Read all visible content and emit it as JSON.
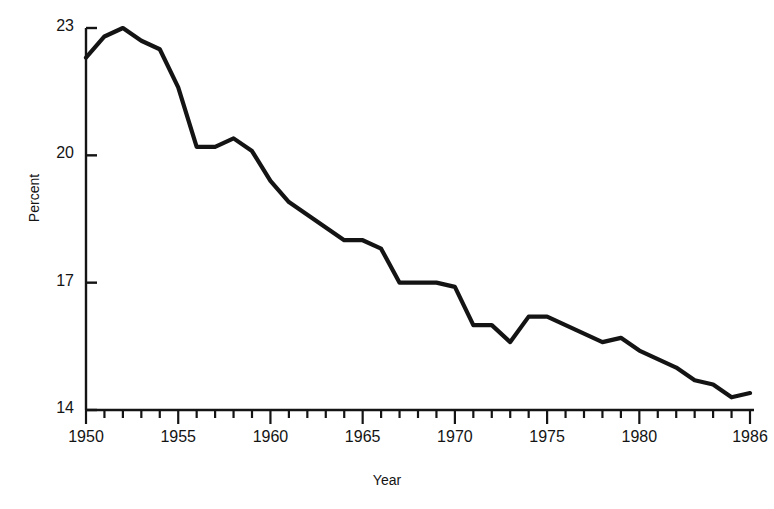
{
  "chart_data": {
    "type": "line",
    "title": "",
    "xlabel": "Year",
    "ylabel": "Percent",
    "xlim": [
      1950,
      1986
    ],
    "ylim": [
      14,
      23
    ],
    "grid": false,
    "legend": null,
    "y_ticks": [
      14,
      17,
      20,
      23
    ],
    "y_tick_labels": [
      "14",
      "17",
      "20",
      "23"
    ],
    "x_ticks": [
      1950,
      1955,
      1960,
      1965,
      1970,
      1975,
      1980,
      1986
    ],
    "x_tick_labels": [
      "1950",
      "1955",
      "1960",
      "1965",
      "1970",
      "1975",
      "1980",
      "1986"
    ],
    "x_minor_tick_interval": 1,
    "line_color": "#141414",
    "line_width": 4,
    "x": [
      1950,
      1951,
      1952,
      1953,
      1954,
      1955,
      1956,
      1957,
      1958,
      1959,
      1960,
      1961,
      1962,
      1963,
      1964,
      1965,
      1966,
      1967,
      1968,
      1969,
      1970,
      1971,
      1972,
      1973,
      1974,
      1975,
      1976,
      1977,
      1978,
      1979,
      1980,
      1981,
      1982,
      1983,
      1984,
      1985,
      1986
    ],
    "values": [
      22.3,
      22.8,
      23.0,
      22.7,
      22.5,
      21.6,
      20.2,
      20.2,
      20.4,
      20.1,
      19.4,
      18.9,
      18.6,
      18.3,
      18.0,
      18.0,
      17.8,
      17.0,
      17.0,
      17.0,
      16.9,
      16.0,
      16.0,
      15.6,
      16.2,
      16.2,
      16.0,
      15.8,
      15.6,
      15.7,
      15.4,
      15.2,
      15.0,
      14.7,
      14.6,
      14.3,
      14.4
    ],
    "series_name": "Percent"
  },
  "axis": {
    "y_title": "Percent",
    "x_title": "Year"
  }
}
